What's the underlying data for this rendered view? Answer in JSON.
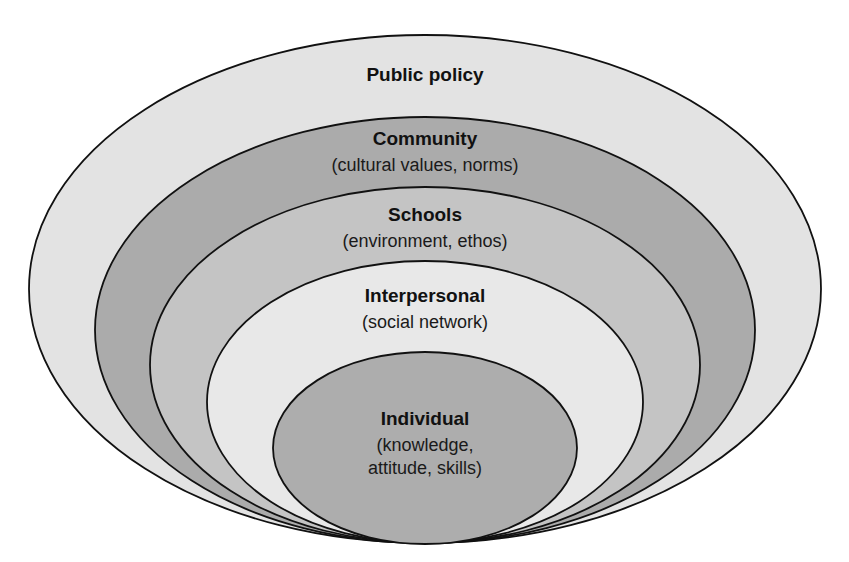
{
  "diagram": {
    "type": "nested-ellipses",
    "stroke_color": "#111111",
    "layers": [
      {
        "id": "public-policy",
        "title": "Public policy",
        "subtitle": "",
        "fill": "#e3e3e3",
        "ellipse": {
          "cx": 425,
          "cy": 289,
          "rx": 396,
          "ry": 254
        },
        "title_y": 81
      },
      {
        "id": "community",
        "title": "Community",
        "subtitle": "(cultural values, norms)",
        "fill": "#ababab",
        "ellipse": {
          "cx": 425,
          "cy": 330,
          "rx": 330,
          "ry": 213
        },
        "title_y": 145,
        "subtitle_y": 171
      },
      {
        "id": "schools",
        "title": "Schools",
        "subtitle": "(environment, ethos)",
        "fill": "#c4c4c4",
        "ellipse": {
          "cx": 425,
          "cy": 365,
          "rx": 275,
          "ry": 178
        },
        "title_y": 221,
        "subtitle_y": 247
      },
      {
        "id": "interpersonal",
        "title": "Interpersonal",
        "subtitle": "(social network)",
        "fill": "#e8e8e8",
        "ellipse": {
          "cx": 425,
          "cy": 402,
          "rx": 218,
          "ry": 141
        },
        "title_y": 302,
        "subtitle_y": 328
      },
      {
        "id": "individual",
        "title": "Individual",
        "subtitle": "(knowledge,",
        "subtitle2": "attitude, skills)",
        "fill": "#adadad",
        "ellipse": {
          "cx": 425,
          "cy": 448,
          "rx": 152,
          "ry": 96
        },
        "title_y": 425,
        "subtitle_y": 451,
        "subtitle2_y": 474
      }
    ]
  }
}
